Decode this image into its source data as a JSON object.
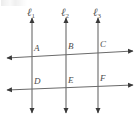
{
  "figure": {
    "background_color": "#ffffff",
    "stroke_color": "#5a5a5a",
    "label_color": "#4a4a4a",
    "width": 140,
    "height": 121
  },
  "parallel_lines": [
    {
      "id": "l1",
      "label": "ℓ",
      "subscript": "1",
      "x": 32,
      "top_y": 18,
      "bottom_y": 113,
      "arrow_top": "up",
      "arrow_bottom": "down"
    },
    {
      "id": "l2",
      "label": "ℓ",
      "subscript": "2",
      "x": 66,
      "top_y": 18,
      "bottom_y": 113,
      "arrow_top": "up",
      "arrow_bottom": "down"
    },
    {
      "id": "l3",
      "label": "ℓ",
      "subscript": "3",
      "x": 98,
      "top_y": 18,
      "bottom_y": 113,
      "arrow_top": "up",
      "arrow_bottom": "down"
    }
  ],
  "transversals": [
    {
      "id": "upper",
      "x1": 7,
      "y1": 58,
      "x2": 133,
      "y2": 51,
      "arrow_left": true,
      "arrow_right": true
    },
    {
      "id": "lower",
      "x1": 7,
      "y1": 90,
      "x2": 133,
      "y2": 85,
      "arrow_left": true,
      "arrow_right": true
    }
  ],
  "points": [
    {
      "id": "A",
      "label": "A",
      "x": 32,
      "y": 56,
      "label_x": 34,
      "label_y": 44
    },
    {
      "id": "B",
      "label": "B",
      "x": 66,
      "y": 54,
      "label_x": 68,
      "label_y": 42
    },
    {
      "id": "C",
      "label": "C",
      "x": 98,
      "y": 52,
      "label_x": 100,
      "label_y": 40
    },
    {
      "id": "D",
      "label": "D",
      "x": 32,
      "y": 89,
      "label_x": 34,
      "label_y": 77
    },
    {
      "id": "E",
      "label": "E",
      "x": 66,
      "y": 88,
      "label_x": 68,
      "label_y": 76
    },
    {
      "id": "F",
      "label": "F",
      "x": 98,
      "y": 86,
      "label_x": 100,
      "label_y": 74
    }
  ],
  "line_labels": [
    {
      "id": "l1",
      "x": 27,
      "y": 7
    },
    {
      "id": "l2",
      "x": 61,
      "y": 7
    },
    {
      "id": "l3",
      "x": 93,
      "y": 7
    }
  ]
}
